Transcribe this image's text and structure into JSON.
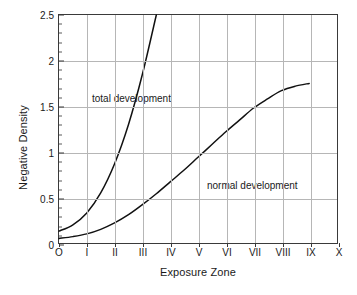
{
  "chart_data": {
    "type": "line",
    "title": "",
    "xlabel": "Exposure Zone",
    "ylabel": "Negative Density",
    "xtick_labels": [
      "O",
      "I",
      "II",
      "III",
      "IV",
      "V",
      "VI",
      "VII",
      "VIII",
      "IX",
      "X"
    ],
    "x": [
      0,
      1,
      2,
      3,
      4,
      5,
      6,
      7,
      8,
      9,
      10
    ],
    "ytick_labels": [
      "0",
      "0.5",
      "1",
      "1.5",
      "2",
      "2.5"
    ],
    "yticks": [
      0,
      0.5,
      1,
      1.5,
      2,
      2.5
    ],
    "ylim": [
      0,
      2.5
    ],
    "xlim": [
      0,
      10
    ],
    "y_minor_step": 0.1,
    "grid": "both",
    "legend": "inline-annotations",
    "series": [
      {
        "name": "total development",
        "label": "total development",
        "color": "#111111",
        "clipped_at_top": true,
        "values": [
          0.13,
          0.2,
          0.33,
          0.55,
          0.87,
          1.3,
          1.85,
          2.5
        ],
        "x": [
          0,
          0.5,
          1,
          1.5,
          2,
          2.5,
          3,
          3.5
        ]
      },
      {
        "name": "normal development",
        "label": "normal development",
        "color": "#111111",
        "clipped_at_top": false,
        "values": [
          0.05,
          0.07,
          0.1,
          0.15,
          0.22,
          0.31,
          0.42,
          0.54,
          0.67,
          0.8,
          0.94,
          1.08,
          1.22,
          1.35,
          1.48,
          1.58,
          1.67,
          1.72,
          1.75
        ],
        "x": [
          0,
          0.5,
          1,
          1.5,
          2,
          2.5,
          3,
          3.5,
          4,
          4.5,
          5,
          5.5,
          6,
          6.5,
          7,
          7.5,
          8,
          8.5,
          9
        ]
      }
    ],
    "annotations": [
      {
        "text": "total development",
        "zone": 1.1,
        "density": 1.72
      },
      {
        "text": "normal development",
        "zone": 5.2,
        "density": 0.78
      }
    ],
    "colors": {
      "background": "#ffffff",
      "frame": "#3a3a3a",
      "gridline": "#b6b6b6",
      "curve": "#111111",
      "text": "#1a1a1a"
    }
  }
}
